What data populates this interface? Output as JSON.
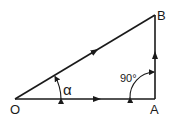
{
  "diagram": {
    "type": "right-triangle-vector-diagram",
    "colors": {
      "stroke": "#1a1a1a",
      "background": "#ffffff"
    },
    "points": {
      "O": {
        "label": "O"
      },
      "A": {
        "label": "A"
      },
      "B": {
        "label": "B"
      }
    },
    "edges": [
      {
        "from": "O",
        "to": "A",
        "arrow": true
      },
      {
        "from": "A",
        "to": "B",
        "arrow": true
      },
      {
        "from": "O",
        "to": "B",
        "arrow": true
      }
    ],
    "angles": {
      "alpha": {
        "vertex": "O",
        "label": "α"
      },
      "right": {
        "vertex": "A",
        "label": "90°"
      }
    }
  }
}
